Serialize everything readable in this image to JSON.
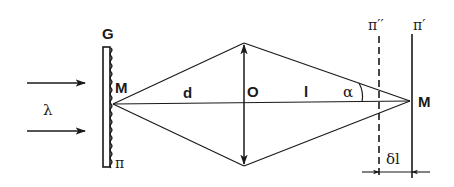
{
  "diagram": {
    "type": "optics-ray-diagram",
    "colors": {
      "line": "#1a1a1a",
      "background": "#ffffff"
    },
    "labels": {
      "grating": "G",
      "point_left": "M",
      "wavelength": "λ",
      "plane_left": "π",
      "distance_d": "d",
      "lens": "O",
      "distance_l": "l",
      "angle": "α",
      "point_right": "M",
      "plane_dashed": "π′′",
      "plane_solid": "π′",
      "delta_l": "δl"
    },
    "elements": {
      "incident_arrows": 2,
      "grating_surface": "wavy",
      "lens_symbol": "double-headed vertical arrow (converging lens)",
      "plane_dashed_style": "dashed",
      "plane_solid_style": "solid",
      "dimension_marker": "δl between π′′ and π′"
    }
  }
}
